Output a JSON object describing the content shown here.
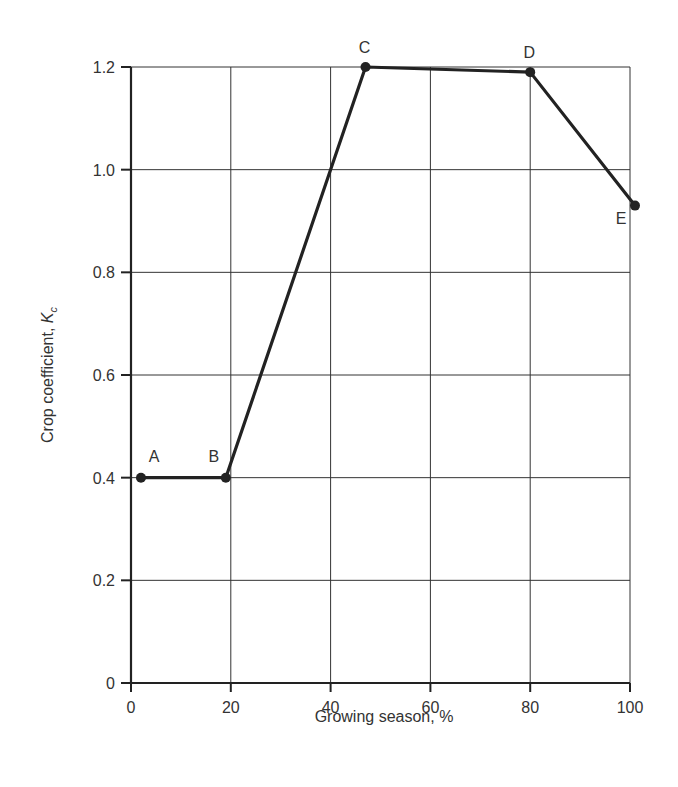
{
  "chart_data": {
    "type": "line",
    "title": "",
    "xlabel": "Growing season, %",
    "ylabel_main": "Crop coefficient, ",
    "ylabel_symbol": "K",
    "ylabel_subscript": "c",
    "xlim": [
      0,
      100
    ],
    "ylim": [
      0,
      1.2
    ],
    "grid": true,
    "legend": null,
    "x_ticks": [
      0,
      20,
      40,
      60,
      80,
      100
    ],
    "x_tick_labels": [
      "0",
      "20",
      "40",
      "60",
      "80",
      "100"
    ],
    "y_ticks": [
      0,
      0.2,
      0.4,
      0.6,
      0.8,
      1.0,
      1.2
    ],
    "y_tick_labels": [
      "0",
      "0.2",
      "0.4",
      "0.6",
      "0.8",
      "1.0",
      "1.2"
    ],
    "series": [
      {
        "name": "Kc curve",
        "points": [
          {
            "label": "A",
            "x": 2,
            "y": 0.4
          },
          {
            "label": "B",
            "x": 19,
            "y": 0.4
          },
          {
            "label": "C",
            "x": 47,
            "y": 1.2
          },
          {
            "label": "D",
            "x": 80,
            "y": 1.19
          },
          {
            "label": "E",
            "x": 101,
            "y": 0.93
          }
        ]
      }
    ],
    "colors": {
      "line": "#222222",
      "grid": "#333333",
      "text": "#333333"
    }
  }
}
